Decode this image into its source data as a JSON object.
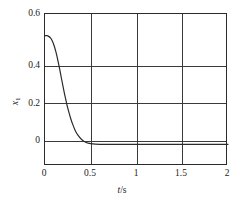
{
  "chart_data": {
    "type": "line",
    "title": "",
    "subtitle": "",
    "xlabel": "t/s",
    "ylabel": "x1",
    "xlim": [
      0,
      2
    ],
    "ylim": [
      -0.1,
      0.6
    ],
    "grid": true,
    "legend": null,
    "x_ticks": [
      {
        "value": 0,
        "label": "0"
      },
      {
        "value": 0.5,
        "label": "0.5"
      },
      {
        "value": 1,
        "label": "1"
      },
      {
        "value": 1.5,
        "label": "1.5"
      },
      {
        "value": 2,
        "label": "2"
      }
    ],
    "y_ticks": [
      {
        "value": 0,
        "label": "0"
      },
      {
        "value": 0.2,
        "label": "0.2"
      },
      {
        "value": 0.4,
        "label": "0.4"
      },
      {
        "value": 0.6,
        "label": "0.6"
      }
    ],
    "series": [
      {
        "name": "x1",
        "color": "#2b2b2b",
        "x": [
          0.0,
          0.02,
          0.04,
          0.06,
          0.08,
          0.1,
          0.12,
          0.14,
          0.16,
          0.18,
          0.2,
          0.22,
          0.24,
          0.26,
          0.28,
          0.3,
          0.33,
          0.36,
          0.4,
          0.45,
          0.5,
          0.6,
          0.8,
          1.0,
          1.25,
          1.5,
          1.75,
          2.0
        ],
        "y": [
          0.5,
          0.5,
          0.497,
          0.49,
          0.476,
          0.454,
          0.424,
          0.388,
          0.347,
          0.303,
          0.26,
          0.219,
          0.182,
          0.149,
          0.12,
          0.095,
          0.064,
          0.042,
          0.022,
          0.008,
          0.003,
          0.0,
          0.0,
          0.0,
          0.0,
          0.0,
          0.0,
          0.0
        ]
      }
    ],
    "annotations": []
  },
  "axis": {
    "y_title_var": "x",
    "y_title_sub": "1",
    "x_title_var": "t",
    "x_title_rest": "/s"
  }
}
